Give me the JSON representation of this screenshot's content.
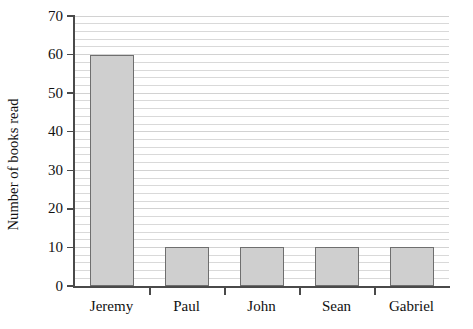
{
  "chart_data": {
    "type": "bar",
    "title": "",
    "xlabel": "",
    "ylabel": "Number of books read",
    "categories": [
      "Jeremy",
      "Paul",
      "John",
      "Sean",
      "Gabriel"
    ],
    "values": [
      60,
      10,
      10,
      10,
      10
    ],
    "ylim": [
      0,
      70
    ],
    "ytick_labels": [
      "0",
      "10",
      "20",
      "30",
      "40",
      "50",
      "60",
      "70"
    ],
    "ytick_values": [
      0,
      10,
      20,
      30,
      40,
      50,
      60,
      70
    ],
    "y_major_step": 10,
    "y_minor_step": 2,
    "grid": "horizontal",
    "legend": "none",
    "bar_fill_color": "#cfcfcf",
    "bar_edge_color": "#6f6f6f",
    "grid_color": "#d9d9d9",
    "axis_color": "#4a4a4a",
    "background_color": "#ffffff"
  }
}
